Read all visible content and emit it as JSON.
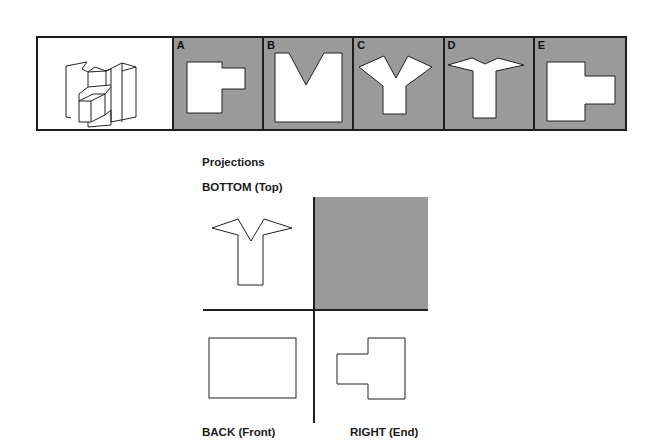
{
  "question": {
    "stem_figure": "isometric-3d-object",
    "options": [
      {
        "label": "A",
        "shape": "l-shaped-block"
      },
      {
        "label": "B",
        "shape": "v-notch-square"
      },
      {
        "label": "C",
        "shape": "y-shape-deep-notch"
      },
      {
        "label": "D",
        "shape": "y-shape-shallow-notch"
      },
      {
        "label": "E",
        "shape": "t-sideways-block"
      }
    ]
  },
  "projections": {
    "heading": "Projections",
    "bottom_label": "BOTTOM (Top)",
    "back_label": "BACK (Front)",
    "right_label": "RIGHT (End)"
  },
  "colors": {
    "panel_grey": "#9a9a9a",
    "line": "#1e1e1e",
    "shape_fill": "#ffffff"
  }
}
